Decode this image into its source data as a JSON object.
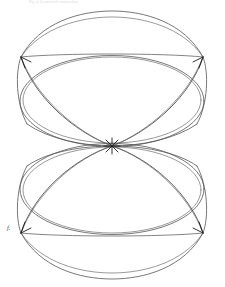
{
  "document": {
    "background_color": "#ffffff",
    "width": 225,
    "height": 287
  },
  "header": {
    "caption_text": "Fig. 4. Geometrical construction",
    "caption_color": "#d6d6d6"
  },
  "figure": {
    "label": "f.",
    "label_color": "#3a3a3a",
    "stroke_color": "#4a4a4a",
    "stroke_color_light": "#6e6e6e",
    "fill_color": "none",
    "stroke_width": 0.8,
    "nodes": {
      "center": {
        "x": 112,
        "y": 146
      },
      "upper_left": {
        "x": 21,
        "y": 57
      },
      "upper_right": {
        "x": 203,
        "y": 57
      },
      "lower_left": {
        "x": 21,
        "y": 233
      },
      "lower_right": {
        "x": 203,
        "y": 233
      }
    },
    "geometry": {
      "upper_ellipse_cx": 112,
      "upper_ellipse_cy": 101,
      "upper_ellipse_rx": 92,
      "upper_ellipse_ry": 57,
      "lower_ellipse_cx": 112,
      "lower_ellipse_cy": 190,
      "lower_ellipse_rx": 92,
      "lower_ellipse_ry": 57,
      "inner_offset": 3.5,
      "petal_count_per_lobe": 2
    }
  }
}
